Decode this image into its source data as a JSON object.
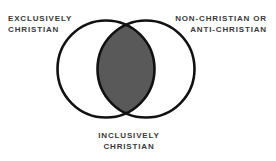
{
  "diagram": {
    "type": "venn",
    "title": "",
    "sets": [
      {
        "id": "left",
        "label": "EXCLUSIVELY\nCHRISTIAN",
        "position": "top-left",
        "fill": "#ffffff"
      },
      {
        "id": "right",
        "label": "NON-CHRISTIAN OR\nANTI-CHRISTIAN",
        "position": "top-right",
        "fill": "#ffffff"
      }
    ],
    "intersection": {
      "id": "overlap",
      "label": "INCLUSIVELY\nCHRISTIAN",
      "position": "bottom-center",
      "fill": "#595959"
    },
    "colors": {
      "background": "#ffffff",
      "stroke": "#111111",
      "circle_fill": "#ffffff",
      "overlap_fill": "#595959",
      "text": "#3a3a3a"
    },
    "geometry": {
      "circle_radius": 48.5,
      "left_center_x": 106,
      "right_center_x": 146,
      "center_y": 69,
      "stroke_width": 2.6
    }
  }
}
